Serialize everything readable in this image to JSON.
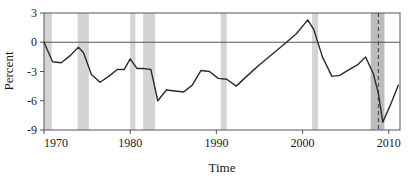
{
  "chart_data": {
    "type": "line",
    "title": "",
    "xlabel": "Time",
    "ylabel": "Percent",
    "xlim": [
      1970,
      2011.3
    ],
    "ylim": [
      -9,
      3
    ],
    "xticks": [
      1970,
      1980,
      1990,
      2000,
      2010
    ],
    "xtick_labels": [
      "1970",
      "1980",
      "1990",
      "2000",
      "2010"
    ],
    "yticks": [
      3,
      0,
      -3,
      -6,
      -9
    ],
    "ytick_labels": [
      "3",
      "0",
      "-3",
      "-6",
      "-9"
    ],
    "grid": false,
    "zero_line": true,
    "legend": "none",
    "line_color": "#2b2b2b",
    "shading_color": "#d4d4d4",
    "shading_color_dark": "#bdbdbd",
    "dashed_line_color": "#4d4d4d",
    "axis_color": "#555555",
    "series": [
      {
        "name": "Percent",
        "x": [
          1970.0,
          1971.0,
          1972.0,
          1973.0,
          1974.0,
          1974.6,
          1975.5,
          1976.5,
          1977.5,
          1978.5,
          1979.3,
          1980.0,
          1980.8,
          1981.6,
          1982.4,
          1983.2,
          1984.2,
          1985.2,
          1986.2,
          1987.2,
          1988.2,
          1989.2,
          1990.2,
          1991.2,
          1992.3,
          1993.5,
          1995.0,
          1996.5,
          1998.0,
          1999.3,
          2000.6,
          2001.3,
          2002.3,
          2003.4,
          2004.3,
          2005.4,
          2006.4,
          2007.3,
          2008.2,
          2008.8,
          2009.3,
          2010.2,
          2011.1
        ],
        "y": [
          0.0,
          -2.0,
          -2.1,
          -1.4,
          -0.5,
          -1.1,
          -3.3,
          -4.1,
          -3.5,
          -2.8,
          -2.8,
          -1.7,
          -2.7,
          -2.7,
          -2.8,
          -6.0,
          -4.9,
          -5.0,
          -5.1,
          -4.4,
          -2.9,
          -3.0,
          -3.7,
          -3.8,
          -4.5,
          -3.5,
          -2.3,
          -1.2,
          -0.1,
          0.9,
          2.3,
          1.3,
          -1.5,
          -3.5,
          -3.4,
          -2.8,
          -2.3,
          -1.5,
          -3.2,
          -5.3,
          -8.2,
          -6.4,
          -4.4
        ]
      }
    ],
    "recession_bands": [
      {
        "start": 1970.0,
        "end": 1970.9,
        "label": "1970 recession",
        "shade": "light"
      },
      {
        "start": 1973.9,
        "end": 1975.2,
        "label": "1973-75 recession",
        "shade": "light"
      },
      {
        "start": 1980.0,
        "end": 1980.6,
        "label": "1980 recession",
        "shade": "light"
      },
      {
        "start": 1981.5,
        "end": 1982.9,
        "label": "1981-82 recession",
        "shade": "light"
      },
      {
        "start": 1990.5,
        "end": 1991.2,
        "label": "1990-91 recession",
        "shade": "light"
      },
      {
        "start": 2001.1,
        "end": 2001.8,
        "label": "2001 recession",
        "shade": "light"
      },
      {
        "start": 2007.9,
        "end": 2009.5,
        "label": "2007-09 recession",
        "shade": "dark"
      }
    ],
    "event_lines": [
      {
        "x": 2008.8,
        "style": "dashed",
        "label": "2008 event marker"
      }
    ]
  }
}
